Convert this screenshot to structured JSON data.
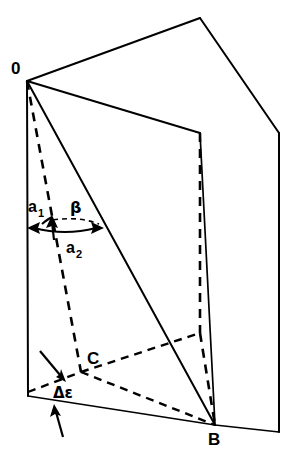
{
  "figure": {
    "type": "geometric-diagram",
    "background_color": "#ffffff",
    "line_color": "#000000",
    "width": 302,
    "height": 465
  },
  "caption": {
    "partial_top_text": ""
  },
  "vertices": [
    {
      "id": "O",
      "label": "0",
      "x": 27,
      "y": 81,
      "label_x": 11,
      "label_y": 74
    },
    {
      "id": "B",
      "label": "B",
      "x": 215,
      "y": 425,
      "label_x": 208,
      "label_y": 445
    },
    {
      "id": "C",
      "label": "C",
      "x": 81,
      "y": 372,
      "label_x": 87,
      "label_y": 364
    }
  ],
  "angle_labels": [
    {
      "id": "a1",
      "base": "a",
      "sub": "1",
      "x": 28,
      "y": 212,
      "sub_x": 39,
      "sub_y": 217
    },
    {
      "id": "beta",
      "glyph": "β",
      "x": 70,
      "y": 213
    },
    {
      "id": "a2",
      "base": "a",
      "sub": "2",
      "x": 66,
      "y": 253,
      "sub_x": 77,
      "sub_y": 258
    },
    {
      "id": "delta_epsilon",
      "glyph": "Δε",
      "x": 53,
      "y": 398
    }
  ],
  "front_plane": {
    "name": "front-plane",
    "points": "27,81 200,133 215,425 28,396"
  },
  "back_plane": {
    "name": "back-plane",
    "points": "27,81 200,18 279,133 279,432"
  },
  "edges": {
    "ridge_upper": "27,81 200,18",
    "ridge_fold": "27,81 200,133",
    "back_top_right": "200,18 279,133",
    "back_right_vertical": "279,133 279,432",
    "back_bottom": "215,425 279,432",
    "front_left_vertical": "27,81 28,396",
    "front_bottom": "28,396 215,425",
    "front_right_vertical": "200,133 215,425",
    "diagonal_OB": "27,81 215,425",
    "hidden_vertical_back": "200,133 200,333",
    "hidden_bottom_back": "200,333 215,425"
  },
  "dashed_edges": {
    "OC_extended": "27,81 81,372",
    "C_to_hidden_corner": "81,372 200,333",
    "C_to_B": "81,372 215,425",
    "left_to_C_base": "28,396 81,372"
  },
  "annotations": {
    "a2_arrow": {
      "from_x": 27,
      "from_y": 228,
      "to_x": 102,
      "to_y": 228
    },
    "beta_arc": {
      "start_x": 50,
      "start_y": 222,
      "end_x": 100,
      "end_y": 226
    },
    "a1_arrow_up": {
      "x": 52,
      "y": 219
    },
    "delta_arrow_upper": {
      "from_x": 43,
      "from_y": 355,
      "to_x": 64,
      "to_y": 380
    },
    "delta_arrow_lower": {
      "from_x": 60,
      "from_y": 430,
      "to_x": 52,
      "to_y": 405
    }
  }
}
